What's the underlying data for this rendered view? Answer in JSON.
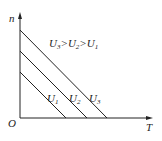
{
  "diagram": {
    "axes": {
      "y_label": "n",
      "x_label": "T",
      "origin_label": "O"
    },
    "relation_text": {
      "parts": [
        "U",
        "3",
        ">U",
        "2",
        ">U",
        "1"
      ]
    },
    "lines": [
      {
        "id": "U1",
        "label": "U",
        "sub": "1",
        "x1": 20,
        "y1": 72,
        "x2": 66,
        "y2": 118
      },
      {
        "id": "U2",
        "label": "U",
        "sub": "2",
        "x1": 20,
        "y1": 51,
        "x2": 87,
        "y2": 118
      },
      {
        "id": "U3",
        "label": "U",
        "sub": "3",
        "x1": 20,
        "y1": 30,
        "x2": 107,
        "y2": 118
      }
    ],
    "line_color": "#222222"
  }
}
